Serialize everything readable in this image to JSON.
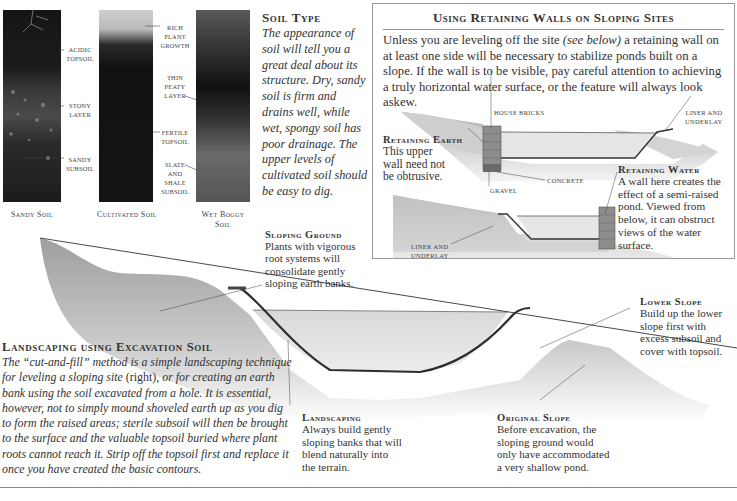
{
  "soil_photos": [
    {
      "caption": "Sandy Soil",
      "callouts": [
        "Acidic Topsoil",
        "Stony Layer",
        "Sandy Subsoil"
      ]
    },
    {
      "caption": "Cultivated Soil",
      "callouts": [
        "Rich Plant Growth",
        "Thin Peaty Layer",
        "Fertile Topsoil",
        "Slate and Shale Subsoil"
      ]
    },
    {
      "caption": "Wet Boggy Soil",
      "callouts": []
    }
  ],
  "callouts_text": {
    "acidic_1": "Acidic",
    "acidic_2": "Topsoil",
    "stony_1": "Stony",
    "stony_2": "Layer",
    "sandy_1": "Sandy",
    "sandy_2": "Subsoil",
    "rich_1": "Rich",
    "rich_2": "Plant",
    "rich_3": "Growth",
    "thin_1": "Thin",
    "thin_2": "Peaty",
    "thin_3": "Layer",
    "fertile_1": "Fertile",
    "fertile_2": "Topsoil",
    "slate_1": "Slate",
    "slate_2": "and",
    "slate_3": "Shale",
    "slate_4": "Subsoil"
  },
  "captions": {
    "sandy": "Sandy Soil",
    "cultivated": "Cultivated Soil",
    "wet_1": "Wet Boggy",
    "wet_2": "Soil"
  },
  "soil_type": {
    "heading": "Soil Type",
    "body": "The appearance of soil will tell you a great deal about its structure. Dry, sandy soil is firm and drains well, while wet, spongy soil has poor drainage. The upper levels of cultivated soil should be easy to dig."
  },
  "retaining_box": {
    "title": "Using Retaining Walls on Sloping Sites",
    "body_before": "Unless you are leveling off the site ",
    "body_italic": "(see below)",
    "body_after": " a retaining wall on at least one side will be necessary to stabilize ponds built on a slope. If the wall is to be visible, pay careful attention to achieving a truly horizontal water surface, or the feature will always look askew.",
    "labels": {
      "house_bricks": "House Bricks",
      "liner_underlay_1": "Liner and",
      "liner_underlay_2": "Underlay",
      "concrete": "Concrete",
      "gravel": "Gravel",
      "liner_underlay_b1": "Liner and",
      "liner_underlay_b2": "Underlay"
    },
    "retaining_earth": {
      "heading": "Retaining Earth",
      "body": "This upper wall need not be obtrusive."
    },
    "retaining_water": {
      "heading": "Retaining Water",
      "body": "A wall here creates the effect of a semi-raised pond. Viewed from below, it can obstruct views of the water surface."
    }
  },
  "sloping_ground": {
    "heading": "Sloping Ground",
    "body": "Plants with vigorous root systems will consolidate gently sloping earth banks."
  },
  "landscaping_excavation": {
    "heading": "Landscaping using Excavation Soil",
    "body_1": "The “cut-and-fill” method is a simple landscaping technique for leveling a sloping site ",
    "body_right": "(right)",
    "body_2": ", or for creating an earth bank using the soil excavated from a hole. It is essential, however, not to simply mound shoveled earth up as you dig to form the raised areas; sterile subsoil will then be brought to the surface and the valuable topsoil buried where plant roots cannot reach it. Strip off the topsoil first and replace it once you have created the basic contours."
  },
  "landscaping": {
    "heading": "Landscaping",
    "body": "Always build gently sloping banks that will blend naturally into the terrain."
  },
  "original_slope": {
    "heading": "Original Slope",
    "body": "Before excavation, the sloping ground would only have accommodated a very shallow pond."
  },
  "lower_slope": {
    "heading": "Lower Slope",
    "body": "Build up the lower slope first with excess subsoil and cover with topsoil."
  },
  "colors": {
    "text": "#2a2a2a",
    "soil_dark": "#1a1a1a",
    "earth_gray": "#bdbdbd",
    "water_gray": "#e2e2e2",
    "liner": "#3a3a3a",
    "brick": "#8a8a8a",
    "rule": "#888888"
  }
}
